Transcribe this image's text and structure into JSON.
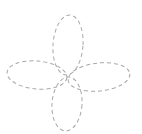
{
  "figure": {
    "type": "four-petal-flower",
    "stroke_color": "#a8a8a8",
    "background": "#ffffff",
    "line_style": "dashed",
    "center": [
      67,
      76
    ],
    "petals": [
      {
        "name": "top",
        "cx": 68,
        "cy": 45,
        "rx": 15,
        "ry": 30,
        "rotate": 4
      },
      {
        "name": "bottom",
        "cx": 67,
        "cy": 104,
        "rx": 15,
        "ry": 27,
        "rotate": 4
      },
      {
        "name": "left",
        "cx": 37,
        "cy": 75,
        "rx": 30,
        "ry": 14,
        "rotate": 5
      },
      {
        "name": "right",
        "cx": 99,
        "cy": 77,
        "rx": 31,
        "ry": 14,
        "rotate": -6
      }
    ]
  }
}
